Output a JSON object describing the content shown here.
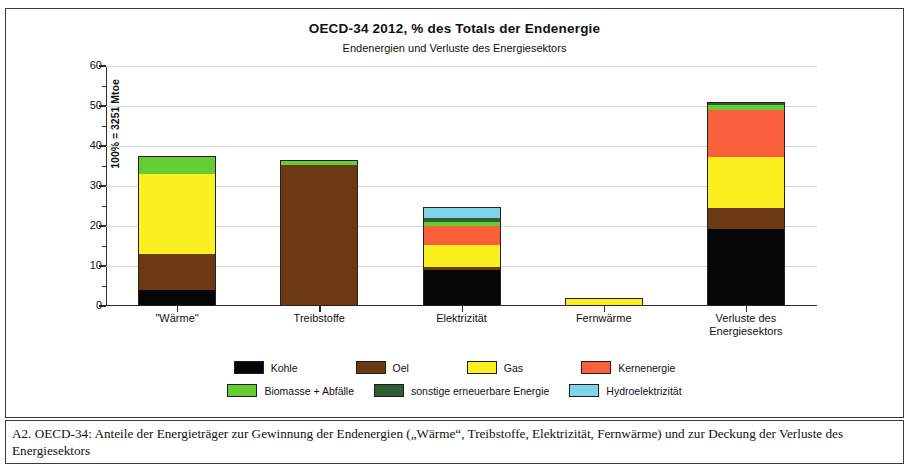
{
  "chart_data": {
    "type": "bar",
    "stacked": true,
    "title": "OECD-34  2012,  % des Totals der Endenergie",
    "subtitle": "Endenergien und Verluste des Energiesektors",
    "xlabel": "",
    "ylabel": "100% = 3251 Mtoe",
    "ylim": [
      0,
      60
    ],
    "yticks": [
      0,
      10,
      20,
      30,
      40,
      50,
      60
    ],
    "ytick_labels": [
      "0",
      "10",
      "20",
      "30",
      "40",
      "50",
      "60"
    ],
    "minor_yticks": [
      5,
      15,
      25,
      35,
      45,
      55
    ],
    "grid": true,
    "legend_position": "bottom",
    "categories": [
      "\"Wärme\"",
      "Treibstoffe",
      "Elektrizität",
      "Fernwärme",
      "Verluste des Energiesektors"
    ],
    "category_lines": [
      [
        "\"Wärme\""
      ],
      [
        "Treibstoffe"
      ],
      [
        "Elektrizität"
      ],
      [
        "Fernwärme"
      ],
      [
        "Verluste des",
        "Energiesektors"
      ]
    ],
    "series": [
      {
        "name": "Kohle",
        "color": "#050505",
        "values": [
          4.0,
          0.0,
          9.0,
          0.2,
          19.3
        ]
      },
      {
        "name": "Oel",
        "color": "#6B3A14",
        "values": [
          9.0,
          35.3,
          0.7,
          0.0,
          5.2
        ]
      },
      {
        "name": "Gas",
        "color": "#FAF020",
        "values": [
          20.0,
          0.0,
          5.6,
          1.4,
          12.8
        ]
      },
      {
        "name": "Kernenergie",
        "color": "#F9603C",
        "values": [
          0.0,
          0.0,
          4.8,
          0.0,
          11.8
        ]
      },
      {
        "name": "Biomasse + Abfälle",
        "color": "#66CC33",
        "values": [
          4.5,
          1.2,
          0.9,
          0.2,
          1.2
        ]
      },
      {
        "name": "sonstige erneuerbare Energie",
        "color": "#2F5E33",
        "values": [
          0.0,
          0.0,
          1.0,
          0.0,
          0.5
        ]
      },
      {
        "name": "Hydroelektrizität",
        "color": "#7FD4E8",
        "values": [
          0.0,
          0.0,
          2.8,
          0.0,
          0.3
        ]
      }
    ],
    "totals": [
      37.5,
      36.5,
      24.8,
      1.8,
      51.1
    ]
  },
  "caption": {
    "text": "A2.  OECD-34:  Anteile der Energieträger zur Gewinnung der Endenergien („Wärme“, Treibstoffe, Elektrizität, Fernwärme) und zur Deckung der Verluste des Energiesektors"
  }
}
